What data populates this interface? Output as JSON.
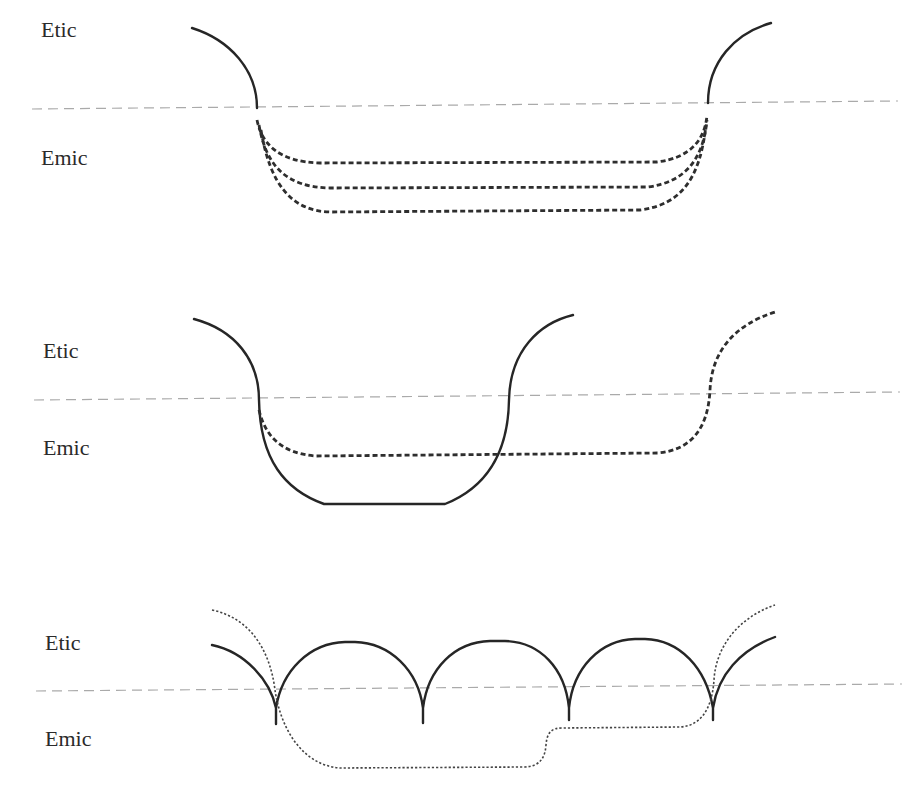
{
  "diagram": {
    "panels": [
      {
        "id": "panel-1",
        "labels": {
          "top": "Etic",
          "bottom": "Emic"
        },
        "description": "Solid etic arcs on both sides joined by three parallel dashed emic paths"
      },
      {
        "id": "panel-2",
        "labels": {
          "top": "Etic",
          "bottom": "Emic"
        },
        "description": "Solid U-shaped path dipping into emic, with a dashed path continuing to a second etic arc on the right"
      },
      {
        "id": "panel-3",
        "labels": {
          "top": "Etic",
          "bottom": "Emic"
        },
        "description": "Series of solid etic arches with cusps dipping into emic, overlaid with a dotted path descending deep into emic"
      }
    ],
    "colors": {
      "boundary_line": "#aaaaaa",
      "solid_path": "#262626",
      "dashed_path": "#2e2e2e",
      "background": "#ffffff"
    }
  }
}
